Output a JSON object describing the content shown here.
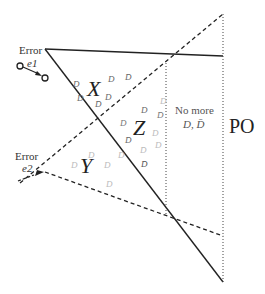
{
  "diagram": {
    "regions": {
      "x_label": "X",
      "y_label": "Y",
      "z_label": "Z",
      "po_label": "PO",
      "no_more_line1": "No more",
      "no_more_line2": "D, D̄"
    },
    "errors": {
      "e1": {
        "title": "Error",
        "sub": "e1"
      },
      "e2": {
        "title": "Error",
        "sub": "e2"
      }
    },
    "tokens": {
      "d": "D",
      "dbar": "D̄"
    },
    "colors": {
      "line": "#222222",
      "token_dark": "#555555",
      "token_light": "#bbbbbb",
      "text": "#333333"
    }
  }
}
